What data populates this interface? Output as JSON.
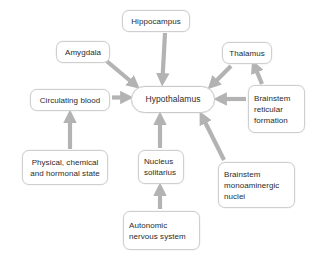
{
  "diagram": {
    "background_color": "#ffffff",
    "node_border_color": "#cfcfcf",
    "arrow_color": "#b3b3b3",
    "text_color": "#2b2b2b",
    "nodes": [
      {
        "id": "hippocampus",
        "label": "Hippocampus"
      },
      {
        "id": "amygdala",
        "label": "Amygdala"
      },
      {
        "id": "thalamus",
        "label": "Thalamus"
      },
      {
        "id": "circulating",
        "label": "Circulating blood"
      },
      {
        "id": "hypothalamus",
        "label": "Hypothalamus"
      },
      {
        "id": "reticular",
        "label": "Brainstem\nreticular\nformation"
      },
      {
        "id": "physical",
        "label": "Physical, chemical\nand hormonal state"
      },
      {
        "id": "nucleus",
        "label": "Nucleus\nsolitarius"
      },
      {
        "id": "monoaminergic",
        "label": "Brainstem\nmonoaminergic\nnuclei"
      },
      {
        "id": "autonomic",
        "label": "Autonomic\nnervous system"
      }
    ],
    "edges": [
      {
        "from": "hippocampus",
        "to": "hypothalamus"
      },
      {
        "from": "amygdala",
        "to": "hypothalamus"
      },
      {
        "from": "thalamus",
        "to": "hypothalamus"
      },
      {
        "from": "circulating",
        "to": "hypothalamus"
      },
      {
        "from": "reticular",
        "to": "hypothalamus"
      },
      {
        "from": "reticular",
        "to": "thalamus"
      },
      {
        "from": "physical",
        "to": "circulating"
      },
      {
        "from": "nucleus",
        "to": "hypothalamus"
      },
      {
        "from": "monoaminergic",
        "to": "hypothalamus"
      },
      {
        "from": "autonomic",
        "to": "nucleus"
      }
    ]
  }
}
